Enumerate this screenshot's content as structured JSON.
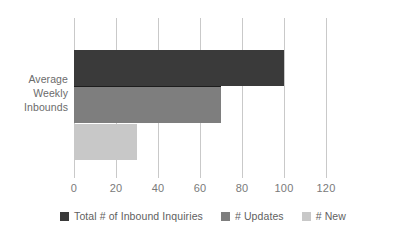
{
  "chart_data": {
    "type": "bar",
    "orientation": "horizontal",
    "title": "",
    "subtitle": "",
    "xlabel": "",
    "ylabel": "",
    "categories": [
      "Average Weekly Inbounds"
    ],
    "category_label_lines": [
      "Average",
      "Weekly",
      "Inbounds"
    ],
    "series": [
      {
        "name": "Total # of Inbound Inquiries",
        "values": [
          100
        ],
        "color": "#3a3a3a"
      },
      {
        "name": "# Updates",
        "values": [
          70
        ],
        "color": "#7e7e7e"
      },
      {
        "name": "# New",
        "values": [
          30
        ],
        "color": "#c8c8c8"
      }
    ],
    "xlim": [
      0,
      120
    ],
    "xticks": [
      0,
      20,
      40,
      60,
      80,
      100,
      120
    ],
    "xtick_labels": [
      "0",
      "20",
      "40",
      "60",
      "80",
      "100",
      "120"
    ],
    "grid": "vertical-only",
    "legend_position": "bottom-center",
    "axis_line": false,
    "colors": {
      "grid": "#c9c9c9",
      "text": "#6b6b6b",
      "tick_text": "#7a7a7a",
      "background": "#ffffff"
    }
  }
}
